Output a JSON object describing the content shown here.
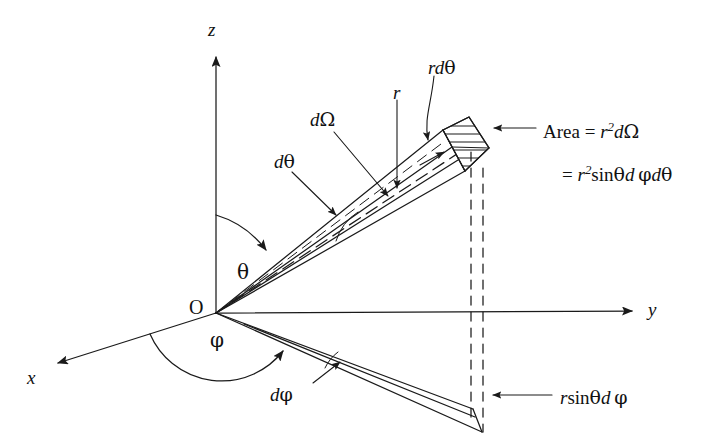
{
  "figure": {
    "background_color": "#ffffff",
    "stroke_color": "#1a1a1a",
    "width": 720,
    "height": 443
  },
  "axes": [
    {
      "name": "z-axis",
      "label": "z",
      "direction": "up",
      "label_x": 208,
      "label_y": 20
    },
    {
      "name": "y-axis",
      "label": "y",
      "direction": "right",
      "label_x": 648,
      "label_y": 300
    },
    {
      "name": "x-axis",
      "label": "x",
      "direction": "down-left",
      "label_x": 27,
      "label_y": 368
    }
  ],
  "origin": {
    "label": "O",
    "label_x": 189,
    "label_y": 297,
    "x": 216,
    "y": 313
  },
  "angles": [
    {
      "name": "polar-angle",
      "label": "θ",
      "label_x": 237,
      "label_y": 262,
      "description": "polar angle from z-axis"
    },
    {
      "name": "azimuthal-angle",
      "label": "φ",
      "label_x": 210,
      "label_y": 330,
      "description": "azimuthal angle in xy-plane from x-axis"
    }
  ],
  "labels": [
    {
      "name": "d-theta-label",
      "text_html": "<i>d</i><span class=\"greek\">θ</span>",
      "x": 274,
      "y": 152,
      "plain": "dθ"
    },
    {
      "name": "d-omega-label",
      "text_html": "<i>d</i><span class=\"greek\">Ω</span>",
      "x": 310,
      "y": 110,
      "plain": "dΩ"
    },
    {
      "name": "r-label",
      "text_html": "<i>r</i>",
      "x": 393,
      "y": 83,
      "plain": "r"
    },
    {
      "name": "r-d-theta-label",
      "text_html": "<i>rd</i><span class=\"greek\">θ</span>",
      "x": 428,
      "y": 58,
      "plain": "rdθ"
    },
    {
      "name": "d-phi-label",
      "text_html": "<i>d</i><span class=\"greek\">φ</span>",
      "x": 270,
      "y": 385,
      "plain": "dφ"
    }
  ],
  "equations": [
    {
      "name": "area-equation-line1",
      "text_html": "<span class=\"up\">Area</span> = <i>r</i><sup>2</sup><i>d</i><span class=\"greek\">Ω</span>",
      "plain": "Area = r2dΩ",
      "x": 543,
      "y": 121
    },
    {
      "name": "area-equation-line2",
      "text_html": "= <i>r</i><sup>2</sup><span class=\"up\">sin</span><span class=\"greek\">θ</span><i>d</i> <span class=\"greek\">φ</span><i>d</i><span class=\"greek\">θ</span>",
      "plain": "= r2sinθd φdθ",
      "x": 562,
      "y": 164
    },
    {
      "name": "arc-length-label",
      "text_html": "<i>r</i><span class=\"up\">sin</span><span class=\"greek\">θ</span><i>d</i> <span class=\"greek\">φ</span>",
      "plain": "rsinθd φ",
      "x": 560,
      "y": 388
    }
  ],
  "geometry_notes": {
    "cone_apex": "origin",
    "cone_axis_style": "dashed",
    "patch_fill": "horizontal-hatching",
    "projection_lines": "two vertical dashed lines dropped from patch to base wedge"
  }
}
